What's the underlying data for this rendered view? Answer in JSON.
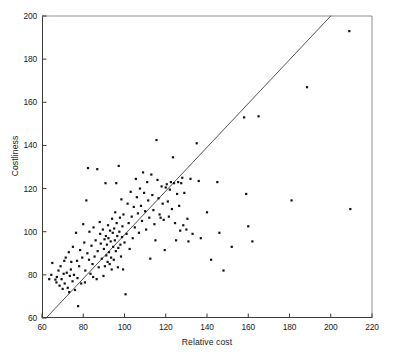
{
  "figure": {
    "caption": "",
    "background_color": "#ffffff",
    "axis_color": "#3a3a3a",
    "point_color": "#111111",
    "line_color": "#404040"
  },
  "chart_data": {
    "type": "scatter",
    "title": "",
    "xlabel": "Relative cost",
    "ylabel": "Costliness",
    "xlim": [
      60,
      220
    ],
    "ylim": [
      60,
      200
    ],
    "xticks": [
      60,
      80,
      100,
      120,
      140,
      160,
      180,
      200,
      220
    ],
    "yticks": [
      60,
      80,
      100,
      120,
      140,
      160,
      180,
      200
    ],
    "xtick_labels": [
      "60",
      "80",
      "100",
      "120",
      "140",
      "160",
      "180",
      "200",
      "220"
    ],
    "ytick_labels": [
      "60",
      "80",
      "100",
      "120",
      "140",
      "160",
      "180",
      "200"
    ],
    "grid": false,
    "legend": null,
    "marker": "square",
    "marker_size_px": 2.2,
    "reference_line": {
      "label": "identity line",
      "x": [
        62,
        200
      ],
      "y": [
        60,
        200
      ],
      "style": "solid",
      "width_px": 0.9
    },
    "n_points": 182,
    "points": [
      [
        65.0,
        85.5
      ],
      [
        66.5,
        77.8
      ],
      [
        67.2,
        79.0
      ],
      [
        67.0,
        76.5
      ],
      [
        68.0,
        82.0
      ],
      [
        68.5,
        75.0
      ],
      [
        69.0,
        84.0
      ],
      [
        69.5,
        78.0
      ],
      [
        70.0,
        73.5
      ],
      [
        70.5,
        80.5
      ],
      [
        71.0,
        76.0
      ],
      [
        71.5,
        88.0
      ],
      [
        72.0,
        81.0
      ],
      [
        72.5,
        74.0
      ],
      [
        73.0,
        90.5
      ],
      [
        73.5,
        79.5
      ],
      [
        74.0,
        82.5
      ],
      [
        74.2,
        86.0
      ],
      [
        74.8,
        77.0
      ],
      [
        75.0,
        93.0
      ],
      [
        75.5,
        80.0
      ],
      [
        76.0,
        73.0
      ],
      [
        76.5,
        99.5
      ],
      [
        77.0,
        86.5
      ],
      [
        77.2,
        78.5
      ],
      [
        77.5,
        65.5
      ],
      [
        78.0,
        84.0
      ],
      [
        78.5,
        91.5
      ],
      [
        79.0,
        76.0
      ],
      [
        79.5,
        88.0
      ],
      [
        80.0,
        103.5
      ],
      [
        80.5,
        95.0
      ],
      [
        81.0,
        82.0
      ],
      [
        81.5,
        114.5
      ],
      [
        82.0,
        90.0
      ],
      [
        82.3,
        129.5
      ],
      [
        82.8,
        87.0
      ],
      [
        83.0,
        100.0
      ],
      [
        83.5,
        80.5
      ],
      [
        84.0,
        93.5
      ],
      [
        84.5,
        85.0
      ],
      [
        85.0,
        102.0
      ],
      [
        85.5,
        88.5
      ],
      [
        86.0,
        96.0
      ],
      [
        86.5,
        78.0
      ],
      [
        86.8,
        129.0
      ],
      [
        87.0,
        91.0
      ],
      [
        87.5,
        83.5
      ],
      [
        88.0,
        104.5
      ],
      [
        88.2,
        99.0
      ],
      [
        88.5,
        94.5
      ],
      [
        89.0,
        87.5
      ],
      [
        89.5,
        101.0
      ],
      [
        89.8,
        79.5
      ],
      [
        90.0,
        92.0
      ],
      [
        90.3,
        96.5
      ],
      [
        90.5,
        84.0
      ],
      [
        90.8,
        122.5
      ],
      [
        91.0,
        98.0
      ],
      [
        91.2,
        89.0
      ],
      [
        91.5,
        94.0
      ],
      [
        91.8,
        86.0
      ],
      [
        92.0,
        103.0
      ],
      [
        92.2,
        97.0
      ],
      [
        92.5,
        90.5
      ],
      [
        92.8,
        85.0
      ],
      [
        93.0,
        100.5
      ],
      [
        93.3,
        95.5
      ],
      [
        93.5,
        88.0
      ],
      [
        93.8,
        82.5
      ],
      [
        94.0,
        106.0
      ],
      [
        94.3,
        99.5
      ],
      [
        94.5,
        93.0
      ],
      [
        94.8,
        87.0
      ],
      [
        95.0,
        101.5
      ],
      [
        95.3,
        96.0
      ],
      [
        95.5,
        109.0
      ],
      [
        95.8,
        91.0
      ],
      [
        96.0,
        122.5
      ],
      [
        96.2,
        104.0
      ],
      [
        96.5,
        98.0
      ],
      [
        96.8,
        83.5
      ],
      [
        97.0,
        92.5
      ],
      [
        97.2,
        130.5
      ],
      [
        97.5,
        100.0
      ],
      [
        97.8,
        106.5
      ],
      [
        98.0,
        94.0
      ],
      [
        98.3,
        88.5
      ],
      [
        98.5,
        115.0
      ],
      [
        98.8,
        97.5
      ],
      [
        99.0,
        102.5
      ],
      [
        99.3,
        82.5
      ],
      [
        99.5,
        108.0
      ],
      [
        100.0,
        95.0
      ],
      [
        100.5,
        71.0
      ],
      [
        101.0,
        99.0
      ],
      [
        101.5,
        113.0
      ],
      [
        102.0,
        104.0
      ],
      [
        102.5,
        92.0
      ],
      [
        103.0,
        118.5
      ],
      [
        103.5,
        107.0
      ],
      [
        104.0,
        97.0
      ],
      [
        104.5,
        111.5
      ],
      [
        105.0,
        102.0
      ],
      [
        105.5,
        124.5
      ],
      [
        106.0,
        116.0
      ],
      [
        106.5,
        108.5
      ],
      [
        107.0,
        99.5
      ],
      [
        107.5,
        120.0
      ],
      [
        108.0,
        112.0
      ],
      [
        108.5,
        105.0
      ],
      [
        109.0,
        127.5
      ],
      [
        109.5,
        118.0
      ],
      [
        110.0,
        109.5
      ],
      [
        110.5,
        101.0
      ],
      [
        111.0,
        123.0
      ],
      [
        111.5,
        114.5
      ],
      [
        112.0,
        106.5
      ],
      [
        112.5,
        87.5
      ],
      [
        113.0,
        126.5
      ],
      [
        113.5,
        117.0
      ],
      [
        114.0,
        110.0
      ],
      [
        114.5,
        103.5
      ],
      [
        115.0,
        96.0
      ],
      [
        115.5,
        142.5
      ],
      [
        116.0,
        124.0
      ],
      [
        116.5,
        115.5
      ],
      [
        117.0,
        108.0
      ],
      [
        117.5,
        106.5
      ],
      [
        118.0,
        121.0
      ],
      [
        118.5,
        113.0
      ],
      [
        119.0,
        105.5
      ],
      [
        119.5,
        91.5
      ],
      [
        120.0,
        120.5
      ],
      [
        120.5,
        122.0
      ],
      [
        121.0,
        114.0
      ],
      [
        121.5,
        107.0
      ],
      [
        122.0,
        119.5
      ],
      [
        122.5,
        123.0
      ],
      [
        123.0,
        110.5
      ],
      [
        123.5,
        134.5
      ],
      [
        124.0,
        122.5
      ],
      [
        124.5,
        104.0
      ],
      [
        125.0,
        96.0
      ],
      [
        125.5,
        117.5
      ],
      [
        126.0,
        123.0
      ],
      [
        126.5,
        112.0
      ],
      [
        127.0,
        100.5
      ],
      [
        127.5,
        122.5
      ],
      [
        128.0,
        125.0
      ],
      [
        128.5,
        103.0
      ],
      [
        129.0,
        118.0
      ],
      [
        130.0,
        101.0
      ],
      [
        130.5,
        106.0
      ],
      [
        131.0,
        95.5
      ],
      [
        132.0,
        124.5
      ],
      [
        133.0,
        99.0
      ],
      [
        135.0,
        141.0
      ],
      [
        136.0,
        123.5
      ],
      [
        137.0,
        97.0
      ],
      [
        140.0,
        109.0
      ],
      [
        142.0,
        87.0
      ],
      [
        145.0,
        123.0
      ],
      [
        146.0,
        99.5
      ],
      [
        148.0,
        82.0
      ],
      [
        152.0,
        93.0
      ],
      [
        158.0,
        153.0
      ],
      [
        159.0,
        117.5
      ],
      [
        160.0,
        102.5
      ],
      [
        162.0,
        95.5
      ],
      [
        165.0,
        153.5
      ],
      [
        181.0,
        114.5
      ],
      [
        188.5,
        167.0
      ],
      [
        209.0,
        193.0
      ],
      [
        209.5,
        110.5
      ],
      [
        63.5,
        78.0
      ],
      [
        64.5,
        80.0
      ],
      [
        70.8,
        86.5
      ],
      [
        73.2,
        72.0
      ],
      [
        80.8,
        76.5
      ],
      [
        84.8,
        79.0
      ]
    ]
  }
}
